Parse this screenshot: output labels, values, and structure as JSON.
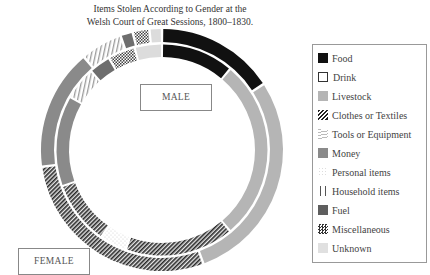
{
  "title": {
    "line1": "Items Stolen According to Gender at the",
    "line2": "Welsh Court of Great Sessions, 1800–1830."
  },
  "labels": {
    "male": "MALE",
    "female": "FEMALE"
  },
  "legend": [
    {
      "key": "food",
      "label": "Food",
      "pattern": "solid-black"
    },
    {
      "key": "drink",
      "label": "Drink",
      "pattern": "white-outline"
    },
    {
      "key": "livestock",
      "label": "Livestock",
      "pattern": "light-grey"
    },
    {
      "key": "clothes",
      "label": "Clothes or Textiles",
      "pattern": "diagonal-hatch"
    },
    {
      "key": "tools",
      "label": "Tools or Equipment",
      "pattern": "horizontal-lines"
    },
    {
      "key": "money",
      "label": "Money",
      "pattern": "mid-grey"
    },
    {
      "key": "personal",
      "label": "Personal items",
      "pattern": "dotted"
    },
    {
      "key": "household",
      "label": "Household items",
      "pattern": "vertical-lines"
    },
    {
      "key": "fuel",
      "label": "Fuel",
      "pattern": "dark-grey"
    },
    {
      "key": "misc",
      "label": "Miscellaneous",
      "pattern": "checker"
    },
    {
      "key": "unknown",
      "label": "Unknown",
      "pattern": "very-light-grey"
    }
  ],
  "colors": {
    "food": "#111111",
    "livestock": "#b5b5b5",
    "money": "#8a8a8a",
    "fuel": "#6e6e6e",
    "unknown": "#dcdcdc",
    "clothes_line": "#2a2a2a",
    "border": "#999999"
  },
  "chart_data": {
    "type": "pie",
    "variant": "concentric-donut",
    "title": "Items Stolen According to Gender at the Welsh Court of Great Sessions, 1800–1830.",
    "unit": "percent (estimated from arc angles)",
    "categories": [
      "Food",
      "Drink",
      "Livestock",
      "Clothes or Textiles",
      "Tools or Equipment",
      "Money",
      "Personal items",
      "Household items",
      "Fuel",
      "Miscellaneous",
      "Unknown"
    ],
    "series": [
      {
        "name": "FEMALE",
        "ring": "outer",
        "segments": [
          {
            "category": "Food",
            "start": 0,
            "end": 57,
            "value": 15.8
          },
          {
            "category": "Livestock",
            "start": 57,
            "end": 160,
            "value": 28.6
          },
          {
            "category": "Clothes or Textiles",
            "start": 160,
            "end": 262,
            "value": 28.3
          },
          {
            "category": "Money",
            "start": 262,
            "end": 320,
            "value": 16.1
          },
          {
            "category": "Household items",
            "start": 320,
            "end": 340,
            "value": 5.6
          },
          {
            "category": "Fuel",
            "start": 340,
            "end": 346,
            "value": 1.7
          },
          {
            "category": "Miscellaneous",
            "start": 346,
            "end": 354,
            "value": 2.2
          },
          {
            "category": "Unknown",
            "start": 354,
            "end": 360,
            "value": 1.7
          }
        ]
      },
      {
        "name": "MALE",
        "ring": "inner",
        "segments": [
          {
            "category": "Food",
            "start": 0,
            "end": 40,
            "value": 11.1
          },
          {
            "category": "Livestock",
            "start": 40,
            "end": 140,
            "value": 27.8
          },
          {
            "category": "Clothes or Textiles",
            "start": 140,
            "end": 200,
            "value": 16.7
          },
          {
            "category": "Personal items",
            "start": 200,
            "end": 215,
            "value": 4.2
          },
          {
            "category": "Clothes or Textiles",
            "start": 215,
            "end": 250,
            "value": 9.7
          },
          {
            "category": "Money",
            "start": 250,
            "end": 300,
            "value": 13.9
          },
          {
            "category": "Household items",
            "start": 300,
            "end": 318,
            "value": 5.0
          },
          {
            "category": "Fuel",
            "start": 318,
            "end": 330,
            "value": 3.3
          },
          {
            "category": "Miscellaneous",
            "start": 330,
            "end": 345,
            "value": 4.2
          },
          {
            "category": "Unknown",
            "start": 345,
            "end": 360,
            "value": 4.2
          }
        ]
      }
    ],
    "legend_position": "right",
    "grid": false
  }
}
